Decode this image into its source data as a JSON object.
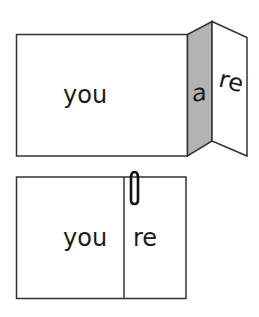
{
  "diagram": {
    "top": {
      "left_panel_text": "you",
      "fold_panel_text": "a",
      "right_panel_text": "re",
      "fold_color": "#b3b3b3"
    },
    "bottom": {
      "left_panel_text": "you",
      "right_panel_text": "re",
      "clip": "paperclip-icon"
    },
    "stroke_color": "#333333"
  }
}
